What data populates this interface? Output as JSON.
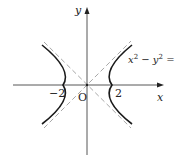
{
  "diagram": {
    "type": "hyperbola",
    "equation_label": {
      "lhs_x": "x",
      "exp": "2",
      "minus": " − ",
      "lhs_y": "y",
      "rhs": " = 4"
    },
    "axes": {
      "x_label": "x",
      "y_label": "y",
      "origin_label": "O"
    },
    "ticks": {
      "neg": "−2",
      "pos": "2"
    },
    "colors": {
      "curve": "#1a1a1a",
      "axis": "#333333",
      "asymptote": "#a8a8a8"
    }
  }
}
